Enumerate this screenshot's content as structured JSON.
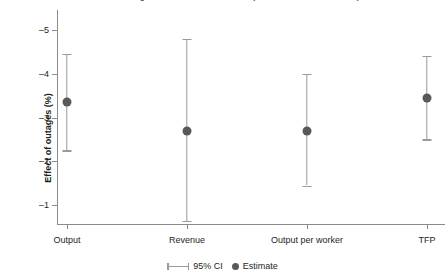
{
  "chart_data": {
    "type": "scatter",
    "title": "Effect of outages on firm-level outcomes (95% confidence intervals)",
    "xlabel": "",
    "ylabel": "Effect of outages (%)",
    "categories": [
      "Output",
      "Revenue",
      "Output per worker",
      "TFP"
    ],
    "series": [
      {
        "name": "Estimate",
        "values": [
          -3.35,
          -2.7,
          -2.7,
          -3.45
        ]
      },
      {
        "name": "95% CI lower",
        "values": [
          -4.45,
          -4.8,
          -4.0,
          -4.4
        ]
      },
      {
        "name": "95% CI upper",
        "values": [
          -2.25,
          -0.65,
          -1.45,
          -2.5
        ]
      }
    ],
    "points": [
      {
        "category": "Output",
        "estimate": -3.35,
        "ci_low": -4.45,
        "ci_high": -2.25
      },
      {
        "category": "Revenue",
        "estimate": -2.7,
        "ci_low": -4.8,
        "ci_high": -0.65
      },
      {
        "category": "Output per worker",
        "estimate": -2.7,
        "ci_low": -4.0,
        "ci_high": -1.45
      },
      {
        "category": "TFP",
        "estimate": -3.45,
        "ci_low": -4.4,
        "ci_high": -2.5
      }
    ],
    "ylim": [
      -5.45,
      -0.55
    ],
    "yticks": [
      -5,
      -4,
      -3,
      -2,
      -1
    ],
    "ytick_labels": [
      "–5",
      "–4",
      "–3",
      "–2",
      "–1"
    ],
    "y_axis_inverted": true,
    "grid": false,
    "legend_position": "bottom",
    "legend": [
      {
        "label": "95% CI",
        "marker": "errorbar-icon",
        "color": "#9a9a9a"
      },
      {
        "label": "Estimate",
        "marker": "circle-icon",
        "color": "#58595b"
      }
    ],
    "colors": {
      "estimate_marker": "#58595b",
      "error_bar": "#9a9a9a",
      "axis": "#8b8b8b",
      "text": "#231f20",
      "background": "#ffffff"
    }
  }
}
